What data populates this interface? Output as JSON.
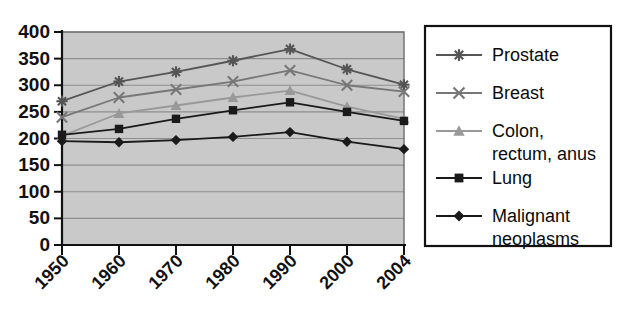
{
  "chart_data": {
    "type": "line",
    "title": "",
    "subtitle": "",
    "xlabel": "",
    "ylabel": "",
    "x": [
      "1950",
      "1960",
      "1970",
      "1980",
      "1990",
      "2000",
      "2004"
    ],
    "categories": [
      "1950",
      "1960",
      "1970",
      "1980",
      "1990",
      "2000",
      "2004"
    ],
    "xlim": [
      0,
      6
    ],
    "ylim": [
      0,
      400
    ],
    "ytick_labels": [
      "400",
      "350",
      "300",
      "250",
      "200",
      "150",
      "100",
      "50",
      "0"
    ],
    "ytick_values": [
      400,
      350,
      300,
      250,
      200,
      150,
      100,
      50,
      0
    ],
    "grid": true,
    "grid_axis": "y",
    "legend_position": "right",
    "plot_background": "#c9c9c9",
    "series": [
      {
        "name": "Prostate",
        "marker": "asterisk",
        "color": "#555555",
        "values": [
          270,
          307,
          325,
          346,
          368,
          330,
          301
        ]
      },
      {
        "name": "Breast",
        "marker": "x-cross",
        "color": "#777777",
        "values": [
          240,
          277,
          292,
          307,
          328,
          300,
          288
        ]
      },
      {
        "name": "Colon, rectum, anus",
        "marker": "triangle",
        "color": "#999999",
        "values": [
          205,
          247,
          262,
          277,
          290,
          260,
          237
        ]
      },
      {
        "name": "Lung",
        "marker": "square",
        "color": "#1a1a1a",
        "values": [
          207,
          218,
          237,
          253,
          268,
          250,
          233
        ]
      },
      {
        "name": "Malignant neoplasms",
        "marker": "diamond",
        "color": "#1a1a1a",
        "values": [
          195,
          193,
          197,
          203,
          212,
          194,
          180
        ]
      }
    ]
  },
  "legend": {
    "entries": [
      {
        "label": "Prostate",
        "label_line2": ""
      },
      {
        "label": "Breast",
        "label_line2": ""
      },
      {
        "label": "Colon,",
        "label_line2": "rectum, anus"
      },
      {
        "label": "Lung",
        "label_line2": ""
      },
      {
        "label": "Malignant",
        "label_line2": "neoplasms"
      }
    ]
  }
}
